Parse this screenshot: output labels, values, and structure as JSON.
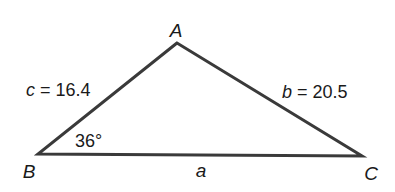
{
  "diagram": {
    "type": "triangle",
    "vertices": {
      "A": {
        "label": "A",
        "x": 177,
        "y": 43
      },
      "B": {
        "label": "B",
        "x": 38,
        "y": 154
      },
      "C": {
        "label": "C",
        "x": 362,
        "y": 156
      }
    },
    "sides": {
      "a": {
        "var": "a",
        "value": ""
      },
      "b": {
        "var": "b",
        "eq": " = ",
        "value": "20.5"
      },
      "c": {
        "var": "c",
        "eq": " = ",
        "value": "16.4"
      }
    },
    "angle_B": {
      "label": "36°"
    },
    "colors": {
      "stroke": "#3a3a3a",
      "text": "#1a1a1a",
      "background": "#ffffff"
    }
  }
}
